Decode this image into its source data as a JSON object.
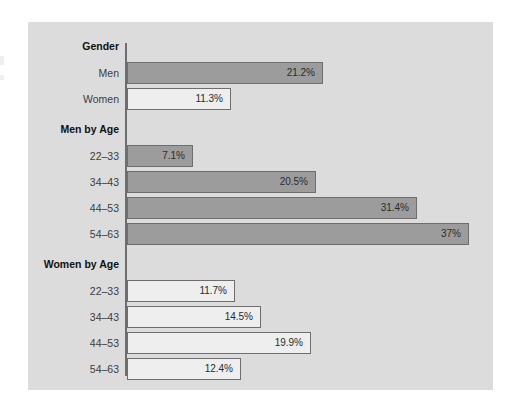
{
  "figure": {
    "background_color": "#ffffff",
    "panel_color": "#dcdcdc",
    "axis_color": "#6e6e6e"
  },
  "chart_data": {
    "type": "bar",
    "orientation": "horizontal",
    "title": "",
    "subtitle": "",
    "xlabel": "",
    "ylabel": "",
    "xlim": [
      0,
      37
    ],
    "grid": false,
    "legend": null,
    "value_suffix": "%",
    "colors": {
      "men": "#9c9c9c",
      "women": "#eeeeee",
      "bar_border": "#6e6e6e"
    },
    "groups": [
      {
        "name": "Gender",
        "label": "Gender",
        "rows": [
          {
            "category": "Men",
            "value": 21.2,
            "label": "21.2%",
            "series": "men"
          },
          {
            "category": "Women",
            "value": 11.3,
            "label": "11.3%",
            "series": "women"
          }
        ]
      },
      {
        "name": "Men by Age",
        "label": "Men by Age",
        "rows": [
          {
            "category": "22–33",
            "value": 7.1,
            "label": "7.1%",
            "series": "men"
          },
          {
            "category": "34–43",
            "value": 20.5,
            "label": "20.5%",
            "series": "men"
          },
          {
            "category": "44–53",
            "value": 31.4,
            "label": "31.4%",
            "series": "men"
          },
          {
            "category": "54–63",
            "value": 37.0,
            "label": "37%",
            "series": "men"
          }
        ]
      },
      {
        "name": "Women by Age",
        "label": "Women by Age",
        "rows": [
          {
            "category": "22–33",
            "value": 11.7,
            "label": "11.7%",
            "series": "women"
          },
          {
            "category": "34–43",
            "value": 14.5,
            "label": "14.5%",
            "series": "women"
          },
          {
            "category": "44–53",
            "value": 19.9,
            "label": "19.9%",
            "series": "women"
          },
          {
            "category": "54–63",
            "value": 12.4,
            "label": "12.4%",
            "series": "women"
          }
        ]
      }
    ],
    "categories": [
      "Men",
      "Women",
      "Men 22–33",
      "Men 34–43",
      "Men 44–53",
      "Men 54–63",
      "Women 22–33",
      "Women 34–43",
      "Women 44–53",
      "Women 54–63"
    ],
    "values": [
      21.2,
      11.3,
      7.1,
      20.5,
      31.4,
      37.0,
      11.7,
      14.5,
      19.9,
      12.4
    ]
  },
  "layout": {
    "group_label_rows": [
      "Gender",
      "Men by Age",
      "Women by Age"
    ]
  }
}
